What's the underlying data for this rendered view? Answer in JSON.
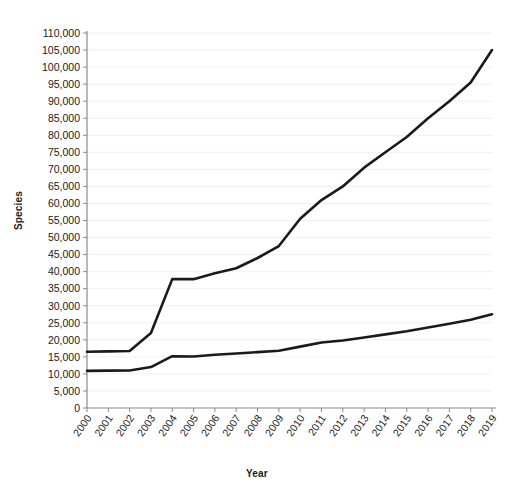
{
  "chart_data": {
    "type": "line",
    "title": "",
    "xlabel": "Year",
    "ylabel": "Species",
    "grid": true,
    "legend": "none",
    "xlim": [
      2000,
      2019
    ],
    "ylim": [
      0,
      110000
    ],
    "ytick_step": 5000,
    "ytick_labels": [
      "110,000",
      "105,000",
      "100,000",
      "95,000",
      "90,000",
      "85,000",
      "80,000",
      "75,000",
      "70,000",
      "65,000",
      "60,000",
      "55,000",
      "50,000",
      "45,000",
      "40,000",
      "35,000",
      "30,000",
      "25,000",
      "20,000",
      "15,000",
      "10,000",
      "5,000",
      "0"
    ],
    "ytick_values": [
      110000,
      105000,
      100000,
      95000,
      90000,
      85000,
      80000,
      75000,
      70000,
      65000,
      60000,
      55000,
      50000,
      45000,
      40000,
      35000,
      30000,
      25000,
      20000,
      15000,
      10000,
      5000,
      0
    ],
    "categories": [
      "2000",
      "2001",
      "2002",
      "2003",
      "2004",
      "2005",
      "2006",
      "2007",
      "2008",
      "2009",
      "2010",
      "2011",
      "2012",
      "2013",
      "2014",
      "2015",
      "2016",
      "2017",
      "2018",
      "2019"
    ],
    "x": [
      2000,
      2001,
      2002,
      2003,
      2004,
      2005,
      2006,
      2007,
      2008,
      2009,
      2010,
      2011,
      2012,
      2013,
      2014,
      2015,
      2016,
      2017,
      2018,
      2019
    ],
    "series": [
      {
        "name": "upper-series",
        "color": "#1a1a1a",
        "values": [
          16500,
          16600,
          16700,
          22000,
          37800,
          37800,
          39500,
          41000,
          44000,
          47500,
          55500,
          61000,
          65000,
          70500,
          75000,
          79500,
          85000,
          90000,
          95500,
          105000
        ]
      },
      {
        "name": "lower-series",
        "color": "#1a1a1a",
        "values": [
          10900,
          10950,
          11000,
          12000,
          15200,
          15100,
          15600,
          16000,
          16400,
          16800,
          18000,
          19200,
          19800,
          20700,
          21600,
          22500,
          23600,
          24700,
          25900,
          27500
        ]
      }
    ]
  },
  "axis": {
    "ylabel_text": "Species",
    "xlabel_text": "Year"
  }
}
